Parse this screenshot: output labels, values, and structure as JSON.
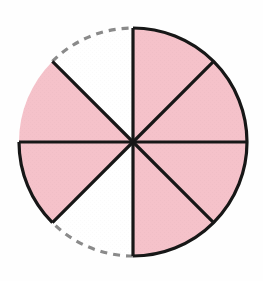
{
  "figure": {
    "name": "fraction-circle",
    "title": "",
    "caption": ""
  },
  "geometry": {
    "center_x": 133,
    "center_y": 142,
    "radius": 114,
    "total_sectors": 8,
    "sector_angle_degrees": 45,
    "shaded_count": 6,
    "unshaded_count": 2,
    "fraction_label": "6/8"
  },
  "colors": {
    "shaded_fill": "#f5c2ca",
    "unshaded_fill": "#ffffff",
    "outline": "#171717",
    "dashed_arc": "#8a8a8a",
    "background": "#fefefe"
  },
  "strokes": {
    "solid_width": 3.2,
    "dashed_width": 3.2,
    "dash_pattern": "7 6"
  },
  "sectors": [
    {
      "id": "sector-1",
      "start_deg": 270,
      "end_deg": 315,
      "state": "shaded",
      "arc_style": "solid",
      "position": "top-left-upper"
    },
    {
      "id": "sector-2",
      "start_deg": 315,
      "end_deg": 0,
      "state": "shaded",
      "arc_style": "solid",
      "position": "top-right-upper"
    },
    {
      "id": "sector-3",
      "start_deg": 0,
      "end_deg": 45,
      "state": "shaded",
      "arc_style": "solid",
      "position": "right-upper"
    },
    {
      "id": "sector-4",
      "start_deg": 45,
      "end_deg": 90,
      "state": "shaded",
      "arc_style": "solid",
      "position": "right-lower"
    },
    {
      "id": "sector-5",
      "start_deg": 90,
      "end_deg": 135,
      "state": "unshaded",
      "arc_style": "dashed",
      "position": "bottom-right"
    },
    {
      "id": "sector-6",
      "start_deg": 135,
      "end_deg": 180,
      "state": "shaded",
      "arc_style": "solid",
      "position": "bottom-left-lower"
    },
    {
      "id": "sector-7",
      "start_deg": 180,
      "end_deg": 225,
      "state": "shaded",
      "arc_style": "solid",
      "position": "left-lower"
    },
    {
      "id": "sector-8",
      "start_deg": 225,
      "end_deg": 270,
      "state": "unshaded",
      "arc_style": "dashed",
      "position": "top-left-outer"
    }
  ],
  "arcs": {
    "solid_segments": [
      {
        "id": "arc-solid-main",
        "from_deg": 270,
        "end_deg": 90,
        "note": "top through right to bottom"
      },
      {
        "id": "arc-solid-lower-left",
        "from_deg": 135,
        "end_deg": 180,
        "note": "bottom left"
      }
    ],
    "dashed_segments": [
      {
        "id": "arc-dashed-bottom-right",
        "from_deg": 90,
        "end_deg": 135
      },
      {
        "id": "arc-dashed-upper-left",
        "from_deg": 225,
        "end_deg": 270
      }
    ]
  },
  "radii": [
    {
      "id": "radius-vertical-up",
      "angle_deg": 270
    },
    {
      "id": "radius-diag-upper-right",
      "angle_deg": 315
    },
    {
      "id": "radius-horizontal-right",
      "angle_deg": 0
    },
    {
      "id": "radius-diag-lower-right",
      "angle_deg": 45
    },
    {
      "id": "radius-vertical-down",
      "angle_deg": 90
    },
    {
      "id": "radius-diag-lower-left",
      "angle_deg": 135
    },
    {
      "id": "radius-horizontal-left",
      "angle_deg": 180
    },
    {
      "id": "radius-diag-upper-left",
      "angle_deg": 225
    }
  ]
}
